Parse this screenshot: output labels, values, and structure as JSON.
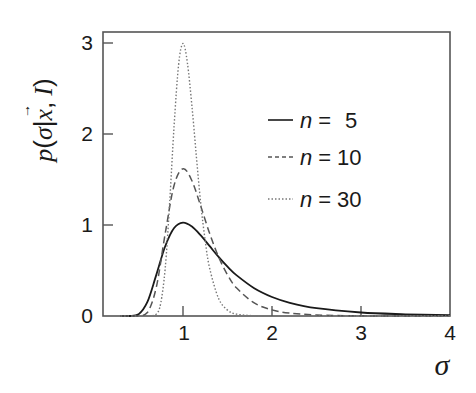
{
  "chart_data": {
    "type": "line",
    "title": "",
    "xlabel": "σ",
    "ylabel": "p(σ|x⃗, I)",
    "xlim": [
      0.1,
      4
    ],
    "ylim": [
      0,
      3.1
    ],
    "x_ticks": [
      "1",
      "2",
      "3",
      "4"
    ],
    "y_ticks": [
      "0",
      "1",
      "2",
      "3"
    ],
    "grid": false,
    "legend_position": "upper right (inside)",
    "series": [
      {
        "name": "n =  5",
        "style": "solid",
        "x": [
          0.3,
          0.4,
          0.5,
          0.6,
          0.7,
          0.8,
          0.9,
          1.0,
          1.1,
          1.2,
          1.3,
          1.4,
          1.5,
          1.6,
          1.8,
          2.0,
          2.2,
          2.5,
          3.0,
          3.5,
          4.0
        ],
        "values": [
          0.0,
          0.0002,
          0.018,
          0.155,
          0.452,
          0.767,
          0.967,
          1.026,
          0.983,
          0.886,
          0.767,
          0.649,
          0.542,
          0.449,
          0.306,
          0.209,
          0.145,
          0.086,
          0.039,
          0.019,
          0.01
        ]
      },
      {
        "name": "n = 10",
        "style": "dashed",
        "x": [
          0.3,
          0.5,
          0.6,
          0.7,
          0.8,
          0.9,
          1.0,
          1.1,
          1.2,
          1.3,
          1.4,
          1.5,
          1.6,
          1.8,
          2.0,
          2.2,
          2.5,
          3.0,
          3.5,
          4.0
        ],
        "values": [
          0.0,
          0.0005,
          0.037,
          0.315,
          0.906,
          1.437,
          1.619,
          1.487,
          1.205,
          0.905,
          0.648,
          0.452,
          0.31,
          0.144,
          0.067,
          0.032,
          0.011,
          0.002,
          0.0005,
          0.0001
        ]
      },
      {
        "name": "n = 30",
        "style": "dotted",
        "x": [
          0.3,
          0.6,
          0.7,
          0.75,
          0.8,
          0.85,
          0.9,
          0.95,
          1.0,
          1.05,
          1.1,
          1.15,
          1.2,
          1.25,
          1.3,
          1.4,
          1.5,
          1.6,
          1.8,
          2.0,
          4.0
        ],
        "values": [
          0.0,
          0.0,
          0.022,
          0.144,
          0.523,
          1.237,
          2.09,
          2.76,
          2.995,
          2.78,
          2.31,
          1.76,
          1.23,
          0.821,
          0.522,
          0.192,
          0.065,
          0.021,
          0.002,
          0.0,
          0.0
        ]
      }
    ]
  },
  "axes": {
    "x_title": "σ",
    "y_title_p": "p",
    "y_title_open": "(",
    "y_title_sigma": "σ",
    "y_title_bar": "|",
    "y_title_x": "x",
    "y_title_arrow": "→",
    "y_title_comma": ",",
    "y_title_I": "I",
    "y_title_close": ")",
    "x_tick_labels": [
      "1",
      "2",
      "3",
      "4"
    ],
    "y_tick_labels": [
      "0",
      "1",
      "2",
      "3"
    ]
  },
  "legend": [
    {
      "n": "n",
      "eq": "=",
      "value": "5"
    },
    {
      "n": "n",
      "eq": "=",
      "value": "10"
    },
    {
      "n": "n",
      "eq": "=",
      "value": "30"
    }
  ]
}
